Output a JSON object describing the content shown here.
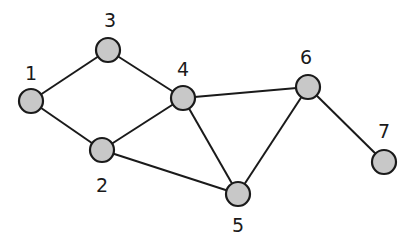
{
  "graph": {
    "node_fill": "#c8c8c8",
    "stroke": "#1a1a1a",
    "nodes": [
      {
        "id": "1",
        "label": "1",
        "x": 31,
        "y": 101,
        "lx": 31,
        "ly": 80
      },
      {
        "id": "2",
        "label": "2",
        "x": 102,
        "y": 150,
        "lx": 102,
        "ly": 192
      },
      {
        "id": "3",
        "label": "3",
        "x": 108,
        "y": 50,
        "lx": 110,
        "ly": 27
      },
      {
        "id": "4",
        "label": "4",
        "x": 183,
        "y": 98,
        "lx": 183,
        "ly": 76
      },
      {
        "id": "5",
        "label": "5",
        "x": 238,
        "y": 194,
        "lx": 238,
        "ly": 232
      },
      {
        "id": "6",
        "label": "6",
        "x": 308,
        "y": 87,
        "lx": 306,
        "ly": 64
      },
      {
        "id": "7",
        "label": "7",
        "x": 384,
        "y": 162,
        "lx": 384,
        "ly": 138
      }
    ],
    "edges": [
      [
        "1",
        "3"
      ],
      [
        "1",
        "2"
      ],
      [
        "3",
        "4"
      ],
      [
        "2",
        "4"
      ],
      [
        "2",
        "5"
      ],
      [
        "4",
        "5"
      ],
      [
        "4",
        "6"
      ],
      [
        "6",
        "5"
      ],
      [
        "6",
        "7"
      ]
    ]
  }
}
